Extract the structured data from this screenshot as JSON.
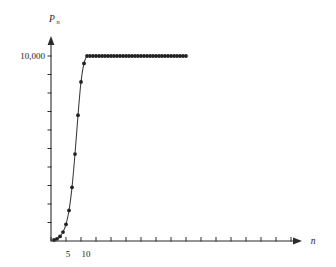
{
  "chart_data": {
    "type": "line",
    "title": "",
    "subtitle": "",
    "xlabel": "n",
    "ylabel": "P",
    "ylabel_subscript": "n",
    "xlim": [
      0,
      48
    ],
    "ylim": [
      0,
      11000
    ],
    "grid": false,
    "legend": null,
    "markers": "filled-circle",
    "y_ticks_labeled": [
      {
        "value": 10000,
        "label": "10,000"
      }
    ],
    "y_ticks_unlabeled_count": 10,
    "x_ticks_labeled": [
      {
        "value": 5,
        "label": "5"
      },
      {
        "value": 10,
        "label": "10"
      }
    ],
    "x_tick_interval": 5,
    "x_tick_count": 17,
    "x": [
      1,
      2,
      3,
      4,
      5,
      6,
      7,
      8,
      9,
      10,
      11,
      12,
      13,
      14,
      15,
      16,
      17,
      18,
      19,
      20,
      21,
      22,
      23,
      24,
      25,
      26,
      27,
      28,
      29,
      30,
      31,
      32,
      33,
      34,
      35,
      36,
      37,
      38,
      39,
      40,
      41,
      42,
      43,
      44,
      45
    ],
    "values": [
      60,
      120,
      250,
      480,
      900,
      1650,
      2900,
      4700,
      6800,
      8600,
      9600,
      10000,
      10000,
      10000,
      10000,
      10000,
      10000,
      10000,
      10000,
      10000,
      10000,
      10000,
      10000,
      10000,
      10000,
      10000,
      10000,
      10000,
      10000,
      10000,
      10000,
      10000,
      10000,
      10000,
      10000,
      10000,
      10000,
      10000,
      10000,
      10000,
      10000,
      10000,
      10000,
      10000,
      10000
    ],
    "series_name": "P_n",
    "annotations": [],
    "colors": {
      "curve": "#3a3a3a",
      "point": "#222222",
      "axis": "#2b2b2b",
      "background": "#ffffff"
    }
  },
  "labels": {
    "y_axis_title": "P",
    "y_axis_title_sub": "n",
    "x_axis_title": "n",
    "y_tick_10000": "10,000",
    "x_tick_5": "5",
    "x_tick_10": "10"
  }
}
